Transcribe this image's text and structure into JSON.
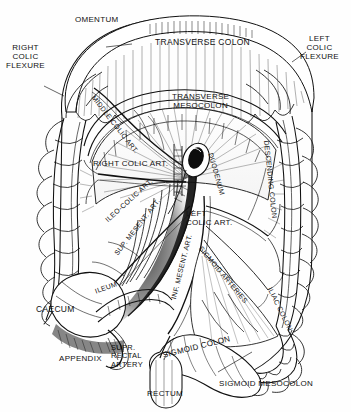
{
  "figure": {
    "background_color": "#fefefe",
    "ink_color": "#111111",
    "width": 351,
    "height": 412
  },
  "labels": {
    "omentum": "OMENTUM",
    "transverse_colon": "TRANSVERSE COLON",
    "right_colic_flexure": "RIGHT\nCOLIC\nFLEXURE",
    "left_colic_flexure": "LEFT\nCOLIC\nFLEXURE",
    "middle_colic_art": "MIDDLE COLIC ART.",
    "transverse_mesocolon": "TRANSVERSE\nMESOCOLON",
    "right_colic_art": "RIGHT COLIC ART.",
    "duodenum": "DUODENUM",
    "descending_colon": "DESCENDING COLON",
    "ileo_colic_art": "ILEO-COLIC ART.",
    "sup_mesent_art": "SUP. MESENT. ART.",
    "inf_mesent_art": "INF. MESENT. ART.",
    "left_colic_art": "LEFT\nCOLIC ART.",
    "sigmoid_arteries": "SIGMOID ARTERIES",
    "iliac_colon": "ILIAC COLON",
    "ileum": "ILEUM",
    "caecum": "CAECUM",
    "appendix": "APPENDIX",
    "supr_rectal_artery": "SUPR.\nRECTAL\nARTERY",
    "sigmoid_colon": "SIGMOID COLON",
    "rectum": "RECTUM",
    "sigmoid_mesocolon": "SIGMOID MESOCOLON"
  }
}
